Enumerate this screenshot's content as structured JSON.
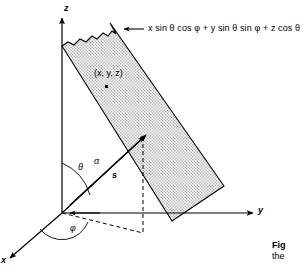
{
  "figure": {
    "background_color": "#ffffff",
    "line_color": "#000000",
    "slab_fill_color": "#d8d8d8",
    "slab_edge_color": "#000000"
  },
  "axes": [
    {
      "name": "z-axis",
      "label": "z",
      "direction": "up"
    },
    {
      "name": "y-axis",
      "label": "y",
      "direction": "right"
    },
    {
      "name": "x-axis",
      "label": "x",
      "direction": "down-left"
    }
  ],
  "plane": {
    "equation": "x sin θ cos φ + y sin θ sin φ + z cos θ = s",
    "equation_parts": {
      "term1": "x sin θ cos φ",
      "term2": "y sin θ sin φ",
      "term3": "z cos θ",
      "rhs": "s"
    },
    "fill": "stippled-gray",
    "torn_edge": "top"
  },
  "point": {
    "label": "(x, y, z)",
    "marker": "square-dot"
  },
  "angles": [
    {
      "name": "theta",
      "label": "θ",
      "between": "z-axis and s vector"
    },
    {
      "name": "phi",
      "label": "φ",
      "between": "x-axis and projection of s"
    }
  ],
  "vectors": [
    {
      "name": "normal-vector",
      "label": "s",
      "style": "bold-italic"
    },
    {
      "name": "alpha-vector",
      "label": "α",
      "style": "italic"
    }
  ],
  "caption": {
    "title": "Fig",
    "body": "the"
  }
}
